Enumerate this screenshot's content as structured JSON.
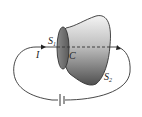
{
  "diagram": {
    "labels": {
      "s1": "S",
      "s1_sub": "1",
      "s2": "S",
      "s2_sub": "2",
      "current": "I",
      "contour": "C"
    },
    "colors": {
      "line": "#333333",
      "disk_fill": "#6a6a6a",
      "surface_light": "#f2f2f2",
      "surface_dark": "#555555"
    },
    "components": [
      "current-carrying wire loop",
      "battery",
      "flat surface S1",
      "bulging surface S2",
      "closed contour C"
    ]
  }
}
